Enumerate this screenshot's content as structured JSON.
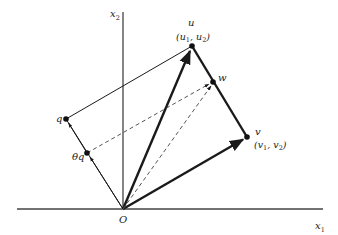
{
  "diagram": {
    "axes": {
      "x_label": "x",
      "x_sub": "1",
      "y_label": "x",
      "y_sub": "2",
      "origin_label": "O"
    },
    "points": {
      "u": {
        "label": "u",
        "coords_label": "(u",
        "c1": "1",
        "sep": ", u",
        "c2": "2",
        "close": ")"
      },
      "v": {
        "label": "v",
        "coords_label": "(v",
        "c1": "1",
        "sep": ", v",
        "c2": "2",
        "close": ")"
      },
      "w": {
        "label": "w"
      },
      "q": {
        "label": "q"
      },
      "theta_q": {
        "label": "θq"
      }
    },
    "colors": {
      "line": "#1a1a1a",
      "axis": "#444444",
      "dashed": "#555555"
    }
  }
}
